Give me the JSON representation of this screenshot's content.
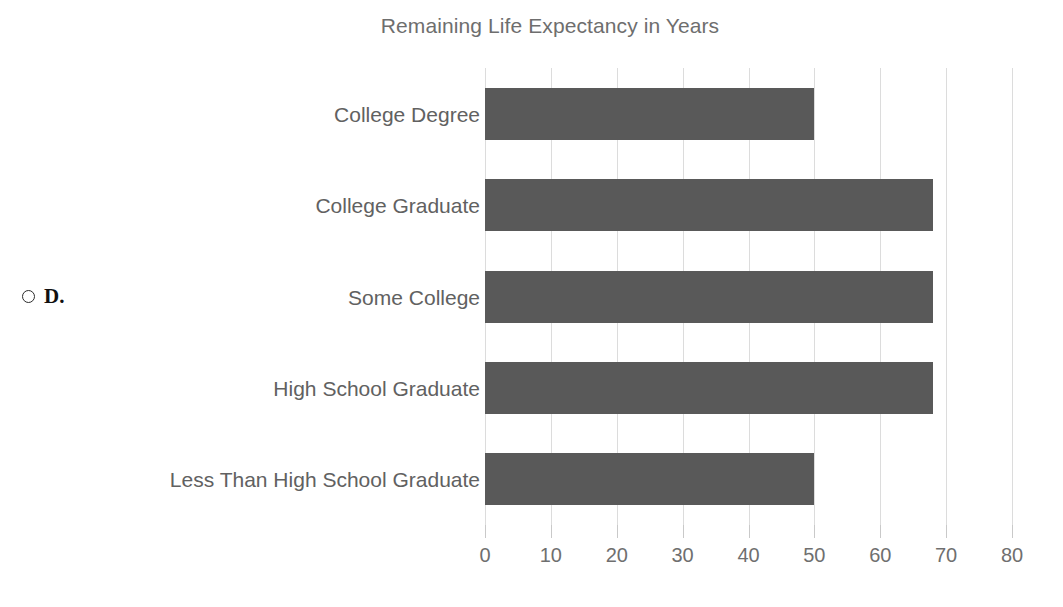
{
  "quiz": {
    "option_letter": "D.",
    "radio_icon": "radio-unselected-icon",
    "selected": false
  },
  "chart_data": {
    "type": "bar",
    "orientation": "horizontal",
    "title": "Remaining Life Expectancy in Years",
    "xlabel": "",
    "ylabel": "",
    "categories": [
      "College Degree",
      "College Graduate",
      "Some College",
      "High School Graduate",
      "Less Than High School Graduate"
    ],
    "values": [
      50,
      68,
      68,
      68,
      50
    ],
    "xlim": [
      0,
      80
    ],
    "xticks": [
      0,
      10,
      20,
      30,
      40,
      50,
      60,
      70,
      80
    ],
    "xtick_labels": [
      "0",
      "10",
      "20",
      "30",
      "40",
      "50",
      "60",
      "70",
      "80"
    ],
    "grid": "vertical-only",
    "legend": "none",
    "bar_color": "#595959",
    "gridline_color": "#dcdcdc",
    "title_color": "#6e6e6e",
    "label_color": "#616161",
    "tick_color": "#6f6f6f",
    "background_color": "#ffffff"
  }
}
